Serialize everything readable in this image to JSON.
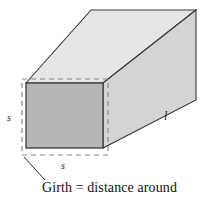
{
  "figure": {
    "type": "geometry-diagram",
    "canvas": {
      "width": 206,
      "height": 201,
      "background": "#ffffff"
    },
    "caption": "Girth = distance around",
    "labels": {
      "side_left": "s",
      "side_bottom": "s",
      "length": "l"
    },
    "colors": {
      "front_face": "#b6b6b6",
      "top_face": "#e6e6e6",
      "side_face": "#d4d4d4",
      "outline": "#3a3a3a",
      "dashed_girth": "#8a8a8a",
      "leader_line": "#2b2b2b",
      "text": "#111111"
    },
    "geometry": {
      "front_face": [
        [
          26,
          83
        ],
        [
          103,
          83
        ],
        [
          103,
          148
        ],
        [
          26,
          148
        ]
      ],
      "top_face": [
        [
          26,
          83
        ],
        [
          91,
          10
        ],
        [
          196,
          10
        ],
        [
          103,
          83
        ]
      ],
      "side_face": [
        [
          103,
          83
        ],
        [
          196,
          10
        ],
        [
          196,
          100
        ],
        [
          103,
          148
        ]
      ],
      "girth_dashed_rect": [
        [
          22,
          79
        ],
        [
          108,
          79
        ],
        [
          108,
          155
        ],
        [
          22,
          155
        ]
      ],
      "leader_line": [
        [
          24,
          157
        ],
        [
          45,
          180
        ]
      ]
    }
  }
}
